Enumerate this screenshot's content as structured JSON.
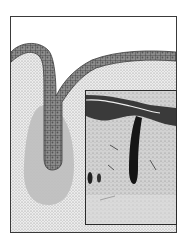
{
  "figure": {
    "description": "Illustration of an epithelial invagination forming a gland bud, with a histology micrograph inset",
    "panels": [
      {
        "name": "drawing",
        "label": "Epithelium folding into underlying tissue (schematic)"
      },
      {
        "name": "micrograph",
        "label": "Histological section showing downgrowth"
      }
    ]
  },
  "colors": {
    "background": "#ffffff",
    "frame": "#3a3a3a",
    "stipple_bg": "#e4e4e4",
    "stipple_dot": "#8a8a8a",
    "epithelium": "#7a7a7a",
    "epithelium_cell": "#4a4a4a",
    "bud_halo": "#bdbdbd",
    "micrograph_bg": "#cfcfcf",
    "micrograph_dark": "#1a1a1a"
  }
}
